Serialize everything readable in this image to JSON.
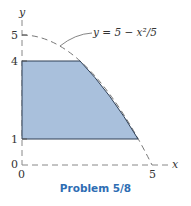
{
  "figure": {
    "caption": "Problem 5/8",
    "curve_label": "y = 5 − x²/5",
    "axes": {
      "x_label": "x",
      "y_label": "y",
      "x_ticks": [
        "0",
        "5"
      ],
      "y_ticks": [
        "0",
        "1",
        "4",
        "5"
      ]
    },
    "region": {
      "description": "Shaded area bounded by x=0, y=1, y=4 and the curve y = 5 − x²/5",
      "fill_color": "#a9c0dc",
      "edge_color": "#2f3f55"
    },
    "colors": {
      "caption": "#2e6db3",
      "dashed": "#777777"
    }
  }
}
